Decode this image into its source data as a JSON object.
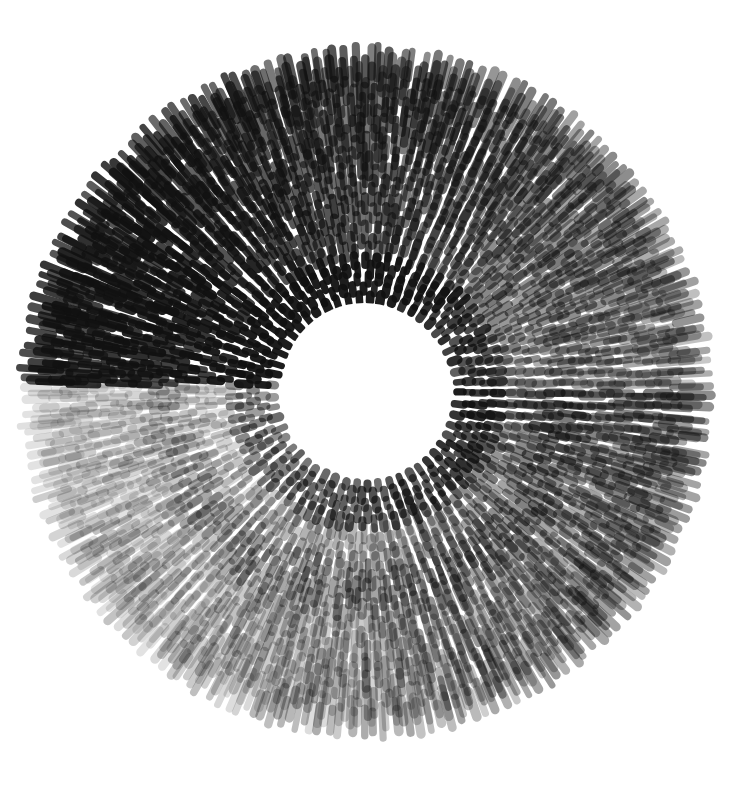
{
  "artwork": {
    "subject": "ink brushstroke radial ring",
    "background": "#ffffff",
    "ink_color": "#111111",
    "center": [
      366,
      392
    ],
    "inner_radius": 84,
    "outer_radius": 330,
    "split_line_y": 385,
    "ring_count": 26,
    "stroke_length": 22,
    "stroke_width": 8,
    "darkest_angle_deg": 200,
    "tone": {
      "dark_opacity": 0.95,
      "light_opacity": 0.12
    }
  }
}
